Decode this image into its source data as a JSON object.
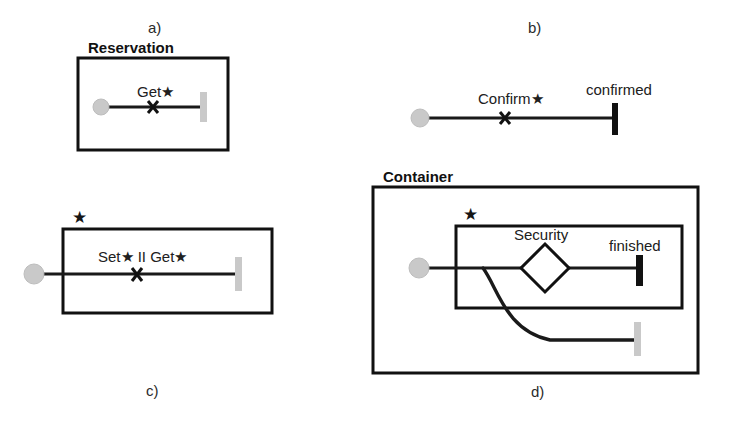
{
  "figure": {
    "caption_letters": [
      {
        "id": "a",
        "label": "a)",
        "x": 148,
        "y": 33
      },
      {
        "id": "b",
        "label": "b)",
        "x": 528,
        "y": 33
      },
      {
        "id": "c",
        "label": "c)",
        "x": 146,
        "y": 396
      },
      {
        "id": "d",
        "label": "d)",
        "x": 531,
        "y": 397
      }
    ],
    "panels": {
      "a": {
        "box_title": "Reservation",
        "transition_label": "Get★",
        "start_node": "initial-state-dot",
        "end_node": "light-bar-terminator",
        "guard_marker": "cross-mark"
      },
      "b": {
        "transition_label": "Confirm★",
        "end_label": "confirmed",
        "start_node": "initial-state-dot",
        "end_node": "dark-bar-terminator",
        "guard_marker": "cross-mark"
      },
      "c": {
        "region_marker": "★",
        "transition_label": "Set★ II Get★",
        "start_node": "initial-state-dot",
        "end_node": "light-bar-terminator",
        "guard_marker": "cross-mark"
      },
      "d": {
        "box_title": "Container",
        "region_marker": "★",
        "decision_label": "Security",
        "end_label": "finished",
        "start_node": "initial-state-dot",
        "end_node_primary": "dark-bar-terminator",
        "end_node_secondary": "light-bar-terminator"
      }
    },
    "colors": {
      "stroke": "#1a1a1a",
      "box_stroke": "#111111",
      "dark_bar": "#111111",
      "light_bar": "#c9c9c9",
      "start_dot": "#c9c9c9",
      "background": "#ffffff"
    }
  }
}
